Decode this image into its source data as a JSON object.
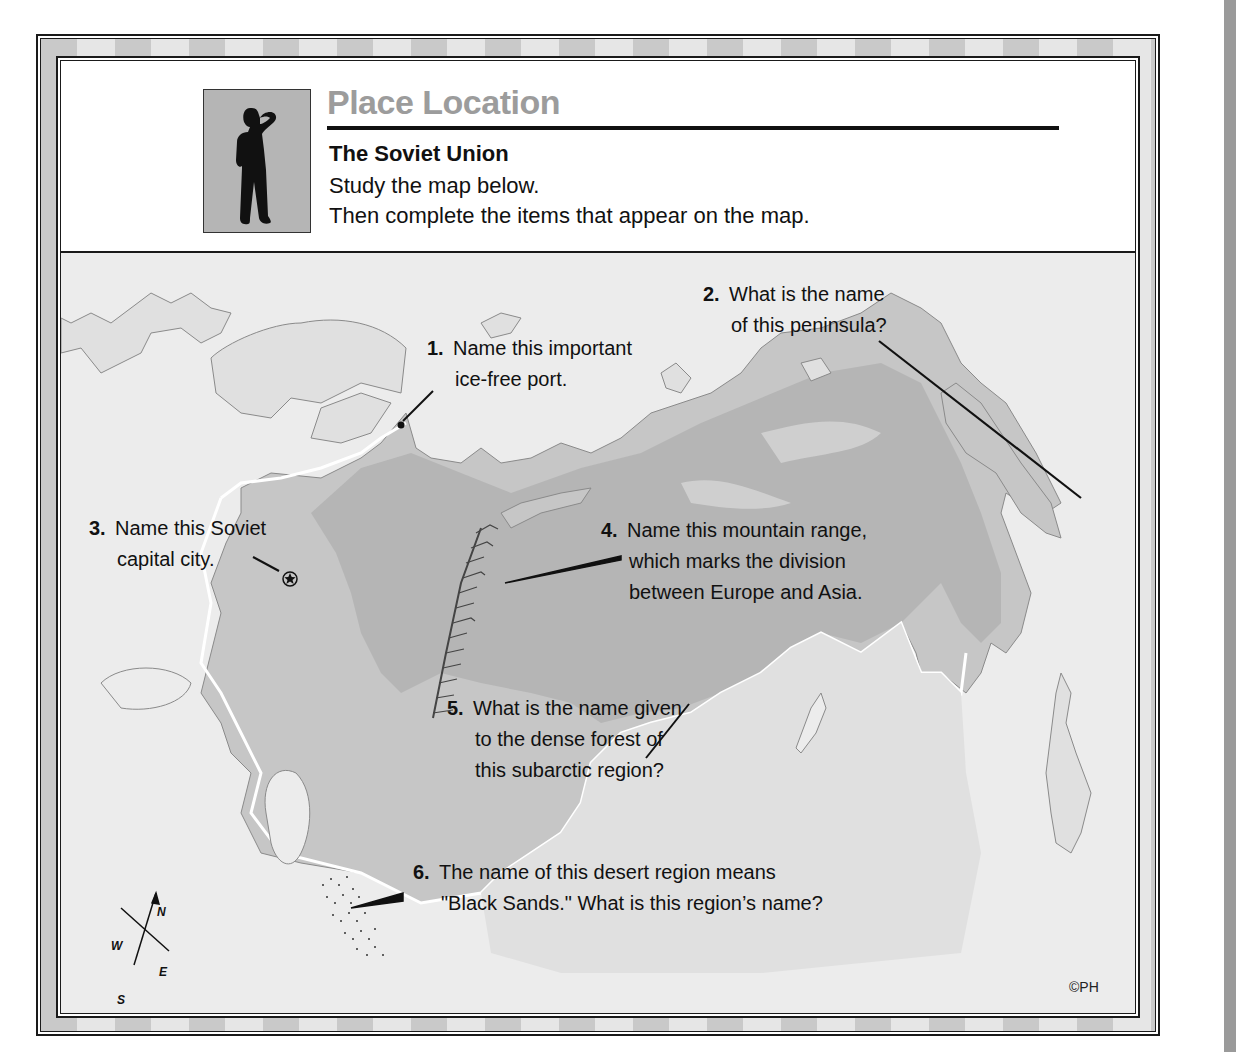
{
  "header": {
    "title": "Place Location",
    "subtitle": "The Soviet Union",
    "instructions": [
      "Study the map below.",
      "Then complete the items that appear on the map."
    ],
    "icon": "person-shading-eyes-silhouette-icon"
  },
  "map": {
    "questions": [
      {
        "num": "1.",
        "lines": [
          "Name this important",
          "ice-free port."
        ]
      },
      {
        "num": "2.",
        "lines": [
          "What is the name",
          "of this peninsula?"
        ]
      },
      {
        "num": "3.",
        "lines": [
          "Name this Soviet",
          "capital city."
        ]
      },
      {
        "num": "4.",
        "lines": [
          "Name this mountain range,",
          "which marks the division",
          "between Europe and Asia."
        ]
      },
      {
        "num": "5.",
        "lines": [
          "What is the name given",
          "to the dense forest of",
          "this subarctic region?"
        ]
      },
      {
        "num": "6.",
        "lines": [
          "The name of this desert region means",
          "\"Black Sands.\"  What is this region’s name?"
        ]
      }
    ],
    "compass": {
      "n": "N",
      "s": "S",
      "e": "E",
      "w": "W"
    },
    "capital_symbol": "star-in-circle-icon",
    "colors": {
      "ocean": "#ececec",
      "foreign_land": "#e0e0e0",
      "soviet_land": "#c6c6c6",
      "taiga": "#b5b5b5",
      "border": "#ffffff",
      "coast": "#8a8a8a"
    }
  },
  "footer": {
    "copyright": "©PH"
  }
}
